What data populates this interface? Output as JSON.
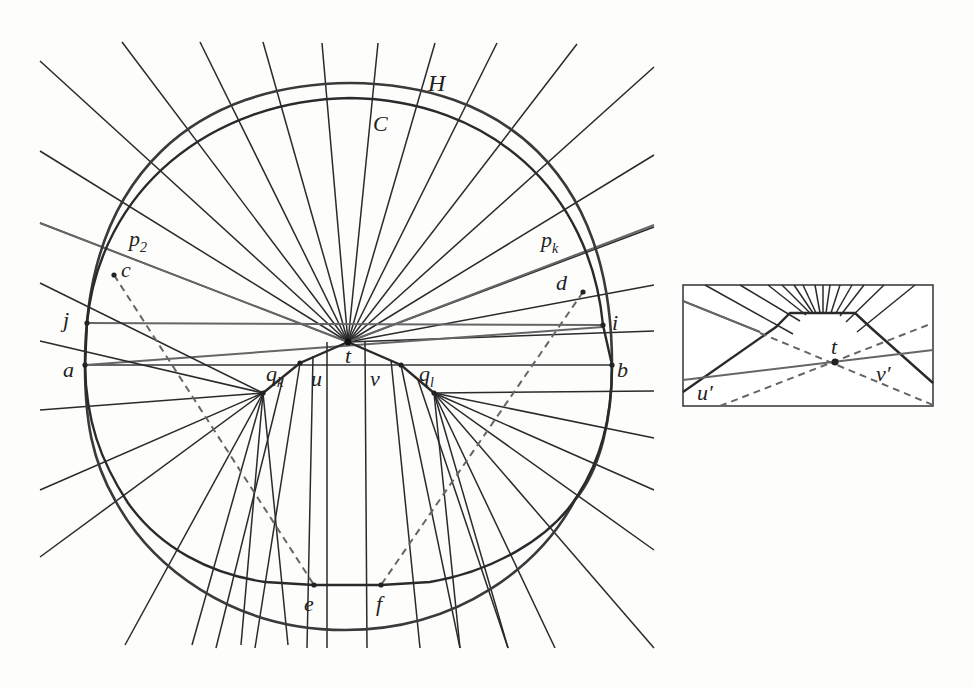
{
  "figure": {
    "type": "geometric-diagram",
    "main": {
      "center_t": [
        348,
        342
      ],
      "labels": [
        {
          "id": "H",
          "text": "H",
          "x": 428,
          "y": 91,
          "size": 24
        },
        {
          "id": "C",
          "text": "C",
          "x": 373,
          "y": 131,
          "size": 22
        },
        {
          "id": "p2",
          "text": "p",
          "sub": "2",
          "x": 129,
          "y": 246,
          "size": 22
        },
        {
          "id": "c",
          "text": "c",
          "x": 121,
          "y": 277,
          "size": 22
        },
        {
          "id": "pk",
          "text": "p",
          "sub": "k",
          "x": 541,
          "y": 247,
          "size": 22
        },
        {
          "id": "d",
          "text": "d",
          "x": 556,
          "y": 290,
          "size": 22
        },
        {
          "id": "j",
          "text": "j",
          "x": 63,
          "y": 327,
          "size": 22
        },
        {
          "id": "i",
          "text": "i",
          "x": 612,
          "y": 330,
          "size": 22
        },
        {
          "id": "a",
          "text": "a",
          "x": 63,
          "y": 377,
          "size": 22
        },
        {
          "id": "b",
          "text": "b",
          "x": 617,
          "y": 377,
          "size": 22
        },
        {
          "id": "t",
          "text": "t",
          "x": 345,
          "y": 363,
          "size": 22
        },
        {
          "id": "qk",
          "text": "q",
          "sub": "k",
          "x": 266,
          "y": 381,
          "size": 22
        },
        {
          "id": "u",
          "text": "u",
          "x": 311,
          "y": 386,
          "size": 22
        },
        {
          "id": "v",
          "text": "v",
          "x": 370,
          "y": 386,
          "size": 22
        },
        {
          "id": "ql",
          "text": "q",
          "sub": "l",
          "x": 419,
          "y": 381,
          "size": 22
        },
        {
          "id": "e",
          "text": "e",
          "x": 304,
          "y": 611,
          "size": 22
        },
        {
          "id": "f",
          "text": "f",
          "x": 376,
          "y": 611,
          "size": 22
        }
      ],
      "points": {
        "a": [
          85,
          365
        ],
        "b": [
          612,
          365
        ],
        "j": [
          87,
          323
        ],
        "i": [
          603,
          325
        ],
        "qk": [
          263,
          393
        ],
        "ql": [
          434,
          393
        ],
        "u": [
          300,
          363
        ],
        "v": [
          401,
          365
        ],
        "c": [
          114,
          275
        ],
        "e": [
          314,
          585
        ],
        "d": [
          583,
          292
        ],
        "f": [
          381,
          585
        ]
      },
      "upper_rays_from_t": [
        [
          40,
          61
        ],
        [
          122,
          42
        ],
        [
          200,
          42
        ],
        [
          263,
          42
        ],
        [
          322,
          43
        ],
        [
          378,
          43
        ],
        [
          435,
          43
        ],
        [
          497,
          43
        ],
        [
          577,
          44
        ],
        [
          654,
          67
        ],
        [
          654,
          155
        ],
        [
          654,
          227
        ]
      ],
      "side_rays_from_t": [
        [
          40,
          151
        ],
        [
          40,
          223
        ],
        [
          654,
          285
        ],
        [
          654,
          331
        ]
      ],
      "gray_lines": [
        {
          "from": [
            40,
            223
          ],
          "to": [
            348,
            342
          ]
        },
        {
          "from": [
            348,
            342
          ],
          "to": [
            654,
            225
          ]
        },
        {
          "from": [
            87,
            323
          ],
          "to": [
            603,
            325
          ]
        },
        {
          "from": [
            85,
            365
          ],
          "to": [
            612,
            365
          ]
        },
        {
          "from": [
            85,
            365
          ],
          "to": [
            603,
            327
          ]
        }
      ],
      "left_fan_from_qk": [
        [
          40,
          283
        ],
        [
          40,
          341
        ],
        [
          40,
          410
        ],
        [
          40,
          490
        ],
        [
          40,
          557
        ],
        [
          125,
          645
        ],
        [
          192,
          645
        ],
        [
          241,
          645
        ],
        [
          288,
          645
        ]
      ],
      "right_fan_from_ql": [
        [
          654,
          391
        ],
        [
          654,
          438
        ],
        [
          654,
          490
        ],
        [
          654,
          550
        ],
        [
          654,
          648
        ],
        [
          555,
          648
        ],
        [
          508,
          648
        ],
        [
          460,
          648
        ]
      ],
      "vertical_rays_from_t": [
        [
          [
            327,
            342
          ],
          [
            327,
            648
          ]
        ],
        [
          [
            365,
            342
          ],
          [
            367,
            648
          ]
        ]
      ],
      "u_rays": [
        [
          [
            300,
            363
          ],
          [
            282,
            460
          ],
          [
            272,
            530
          ],
          [
            255,
            648
          ]
        ],
        [
          [
            313,
            355
          ],
          [
            307,
            648
          ]
        ]
      ],
      "v_rays": [
        [
          [
            391,
            360
          ],
          [
            420,
            648
          ]
        ],
        [
          [
            401,
            365
          ],
          [
            413,
            400
          ]
        ]
      ]
    },
    "inset": {
      "box": [
        683,
        285,
        250,
        121
      ],
      "labels": [
        {
          "id": "t_prime",
          "text": "t",
          "x": 831,
          "y": 354,
          "size": 22
        },
        {
          "id": "u_prime",
          "text": "u′",
          "x": 697,
          "y": 400,
          "size": 22
        },
        {
          "id": "v_prime",
          "text": "v′",
          "x": 876,
          "y": 381,
          "size": 22
        }
      ],
      "point_t": [
        835,
        362
      ]
    }
  }
}
